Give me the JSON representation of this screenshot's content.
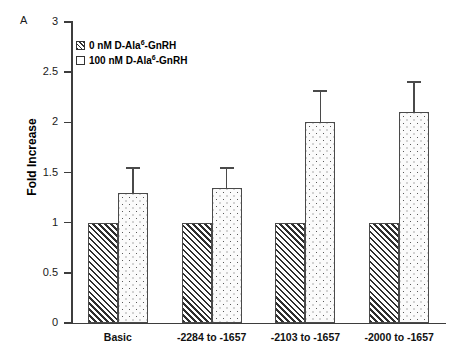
{
  "panel": {
    "letter": "A"
  },
  "axes": {
    "ylabel": "Fold Increase",
    "yticks": [
      "0",
      "0.5",
      "1",
      "1.5",
      "2",
      "2.5",
      "3"
    ]
  },
  "legend": {
    "items": [
      {
        "pattern": "hatch",
        "prefix": "0 nM D-Ala",
        "sup": "6",
        "suffix": "-GnRH",
        "full": "0 nM D-Ala6-GnRH"
      },
      {
        "pattern": "dots",
        "prefix": "100 nM D-Ala",
        "sup": "6",
        "suffix": "-GnRH",
        "full": "100 nM D-Ala6-GnRH"
      }
    ]
  },
  "chart_data": {
    "type": "bar",
    "title": "",
    "xlabel": "",
    "ylabel": "Fold Increase",
    "ylim": [
      0,
      3
    ],
    "ytick_step": 0.5,
    "grid": false,
    "legend_position": "top-left-inside",
    "categories": [
      "Basic",
      "-2284 to -1657",
      "-2103 to -1657",
      "-2000 to -1657"
    ],
    "series": [
      {
        "name": "0 nM D-Ala6-GnRH",
        "pattern": "diagonal-hatch",
        "values": [
          1.0,
          1.0,
          1.0,
          1.0
        ],
        "errors": [
          0,
          0,
          0,
          0
        ]
      },
      {
        "name": "100 nM D-Ala6-GnRH",
        "pattern": "dotted",
        "values": [
          1.3,
          1.35,
          2.0,
          2.1
        ],
        "errors": [
          0.25,
          0.2,
          0.32,
          0.31
        ]
      }
    ]
  }
}
